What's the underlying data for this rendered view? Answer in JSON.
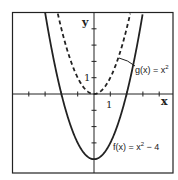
{
  "chart_data": {
    "type": "line",
    "title": "",
    "xlabel": "x",
    "ylabel": "y",
    "xlim": [
      -5,
      4.9
    ],
    "ylim": [
      -5,
      5
    ],
    "grid": false,
    "axis_tick_labels": {
      "x": "1",
      "y": "1"
    },
    "x_ticks": [
      -4,
      -3,
      -2,
      -1,
      1,
      2,
      3,
      4
    ],
    "y_ticks": [
      -4,
      -3,
      -2,
      -1,
      1,
      2,
      3,
      4
    ],
    "series": [
      {
        "name": "f(x) = x² − 4",
        "style": "solid",
        "formula": "x^2 - 4",
        "x": [
          -3,
          -2,
          -1,
          0,
          1,
          2,
          3
        ],
        "values": [
          5,
          0,
          -3,
          -4,
          -3,
          0,
          5
        ]
      },
      {
        "name": "g(x) = x²",
        "style": "dashed",
        "formula": "x^2",
        "x": [
          -2.236,
          -2,
          -1,
          0,
          1,
          2,
          2.236
        ],
        "values": [
          5,
          4,
          1,
          0,
          1,
          4,
          5
        ]
      }
    ],
    "annotations": [
      {
        "text": "g(x) = x²",
        "points_to": "dashed curve"
      },
      {
        "text": "f(x) = x² − 4",
        "points_to": "solid curve"
      }
    ]
  },
  "labels": {
    "x_axis": "x",
    "y_axis": "y",
    "x_tick_one": "1",
    "y_tick_one": "1",
    "g_label": "g(x) = x",
    "g_exp": "2",
    "f_label_a": "f(x) = x",
    "f_exp": "2",
    "f_label_b": " − 4"
  },
  "colors": {
    "ink": "#222222",
    "background": "#ffffff"
  }
}
